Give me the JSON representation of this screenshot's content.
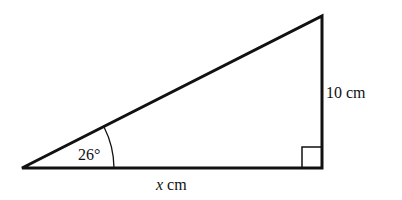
{
  "diagram": {
    "type": "right-triangle",
    "angle_label": "26°",
    "opposite_side_label": "10 cm",
    "adjacent_side_var": "x",
    "adjacent_side_unit": " cm",
    "right_angle_marker": true,
    "stroke_color": "#111111"
  }
}
